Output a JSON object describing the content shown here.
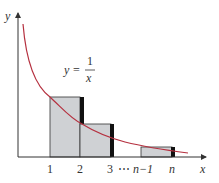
{
  "figure": {
    "function_label": {
      "lhs": "y",
      "eq": "=",
      "numerator": "1",
      "denominator": "x"
    },
    "axes": {
      "x_label": "x",
      "y_label": "y"
    },
    "ticks": [
      {
        "label": "1",
        "italic": false
      },
      {
        "label": "2",
        "italic": false
      },
      {
        "label": "3",
        "italic": false
      },
      {
        "label": "⋯",
        "italic": false
      },
      {
        "label": "n−1",
        "italic": true
      },
      {
        "label": "n",
        "italic": true
      }
    ],
    "colors": {
      "curve": "#b5303f",
      "rect_fill": "#cfd1d4",
      "rect_stroke": "#333333",
      "bar": "#111111",
      "axis": "#333333"
    }
  }
}
